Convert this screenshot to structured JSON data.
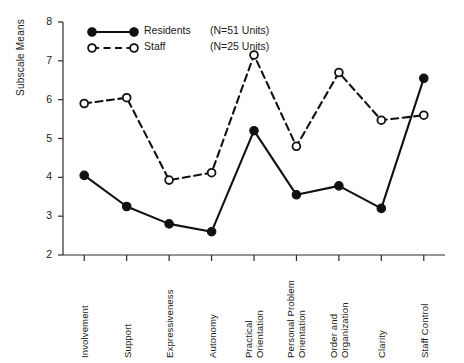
{
  "chart_data": {
    "type": "line",
    "title": "",
    "subtitle": "",
    "xlabel": "",
    "ylabel": "Subscale Means",
    "ylim": [
      2,
      8
    ],
    "yticks": [
      2,
      3,
      4,
      5,
      6,
      7,
      8
    ],
    "grid": false,
    "legend_position": "top-left",
    "categories": [
      "Involvement",
      "Support",
      "Expressiveness",
      "Autonomy",
      "Practical Orientation",
      "Personal Problem Orientation",
      "Order and Organization",
      "Clarity",
      "Staff Control"
    ],
    "category_lines": [
      [
        "Involvement"
      ],
      [
        "Support"
      ],
      [
        "Expressiveness"
      ],
      [
        "Autonomy"
      ],
      [
        "Practical",
        "Orientation"
      ],
      [
        "Personal Problem",
        "Orientation"
      ],
      [
        "Order and",
        "Organization"
      ],
      [
        "Clarity"
      ],
      [
        "Staff Control"
      ]
    ],
    "series": [
      {
        "name": "Residents",
        "n_label": "(N=51 Units)",
        "marker": "filled-circle",
        "linestyle": "solid",
        "color": "#111111",
        "values": [
          4.05,
          3.25,
          2.8,
          2.6,
          5.2,
          3.55,
          3.78,
          3.2,
          6.55
        ]
      },
      {
        "name": "Staff",
        "n_label": "(N=25 Units)",
        "marker": "open-circle",
        "linestyle": "dashed",
        "color": "#111111",
        "values": [
          5.9,
          6.05,
          3.93,
          4.12,
          7.15,
          4.8,
          6.7,
          5.47,
          5.6
        ]
      }
    ]
  },
  "axis": {
    "ylabel": "Subscale Means",
    "ytick_labels": [
      "8",
      "7",
      "6",
      "5",
      "4",
      "3",
      "2"
    ]
  },
  "legend": {
    "entries": [
      {
        "label": "Residents",
        "n": "(N=51 Units)"
      },
      {
        "label": "Staff",
        "n": "(N=25 Units)"
      }
    ]
  }
}
